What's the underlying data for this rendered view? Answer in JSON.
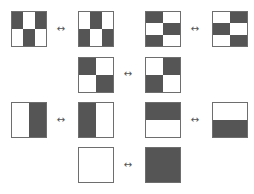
{
  "diagram": {
    "title": "",
    "colors": {
      "dark": "#555555",
      "light": "#ffffff",
      "border": "#6e6e6e"
    },
    "arrow_glyph": "↔",
    "pairs": [
      {
        "row": 1,
        "left": {
          "cols": 3,
          "rows": 2,
          "cells": [
            1,
            0,
            1,
            0,
            1,
            0
          ]
        },
        "right": {
          "cols": 3,
          "rows": 2,
          "cells": [
            0,
            1,
            0,
            1,
            0,
            1
          ]
        }
      },
      {
        "row": 1,
        "left": {
          "cols": 2,
          "rows": 3,
          "cells": [
            1,
            0,
            0,
            1,
            1,
            0
          ]
        },
        "right": {
          "cols": 2,
          "rows": 3,
          "cells": [
            0,
            1,
            1,
            0,
            0,
            1
          ]
        }
      },
      {
        "row": 2,
        "left": {
          "cols": 2,
          "rows": 2,
          "cells": [
            1,
            0,
            0,
            1
          ]
        },
        "right": {
          "cols": 2,
          "rows": 2,
          "cells": [
            0,
            1,
            1,
            0
          ]
        }
      },
      {
        "row": 3,
        "left": {
          "cols": 2,
          "rows": 1,
          "cells": [
            0,
            1
          ]
        },
        "right": {
          "cols": 2,
          "rows": 1,
          "cells": [
            1,
            0
          ]
        }
      },
      {
        "row": 3,
        "left": {
          "cols": 1,
          "rows": 2,
          "cells": [
            1,
            0
          ]
        },
        "right": {
          "cols": 1,
          "rows": 2,
          "cells": [
            0,
            1
          ]
        }
      },
      {
        "row": 4,
        "left": {
          "cols": 1,
          "rows": 1,
          "cells": [
            0
          ]
        },
        "right": {
          "cols": 1,
          "rows": 1,
          "cells": [
            1
          ]
        }
      }
    ]
  }
}
